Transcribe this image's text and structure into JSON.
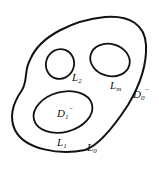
{
  "diagram": {
    "stroke_color": "#111111",
    "background": "#ffffff",
    "contours": {
      "outer": {
        "main": "L",
        "sub": "0"
      },
      "inner_1": {
        "main": "L",
        "sub": "1"
      },
      "inner_2": {
        "main": "L",
        "sub": "2"
      },
      "inner_m": {
        "main": "L",
        "sub": "m"
      }
    },
    "regions": {
      "outer_exterior": {
        "main": "D",
        "sub": "0",
        "sup": "−"
      },
      "inner_1_interior": {
        "main": "D",
        "sub": "1",
        "sup": "−"
      }
    }
  }
}
